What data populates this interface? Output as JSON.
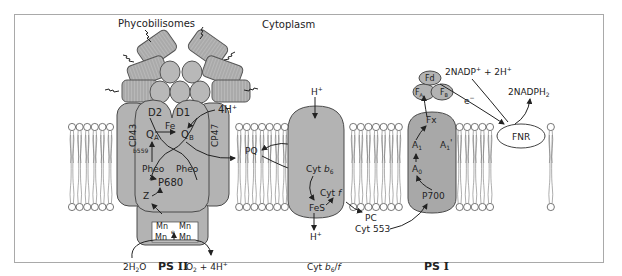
{
  "diagram": {
    "title_region": "Cytoplasm",
    "complexes": [
      {
        "id": "ps2",
        "label": "PS II",
        "subunits": [
          "CP43",
          "D2",
          "D1",
          "CP47"
        ]
      },
      {
        "id": "cytb6f",
        "label": "Cyt b6/f"
      },
      {
        "id": "ps1",
        "label": "PS I"
      }
    ],
    "labels": {
      "phycobilisomes": "Phycobilisomes",
      "cytoplasm": "Cytoplasm",
      "cp43": "CP43",
      "cp47": "CP47",
      "d2": "D2",
      "d1": "D1",
      "fe": "Fe",
      "qa": "Q",
      "qa_sub": "A",
      "qb": "Q",
      "qb_sub": "B",
      "b559": "b559",
      "pheo_left": "Pheo",
      "pheo_right": "Pheo",
      "p680": "P680",
      "z": "Z",
      "mn": "Mn",
      "e_minus_small": "e",
      "ps2_h_out": "4H",
      "h2o": "2H",
      "h2o_sub": "2",
      "h2o_tail": "O",
      "ps2_label": "PS",
      "ps2_roman": "II",
      "o2": "O",
      "o2_sub": "2",
      "o2_tail": " + 4H",
      "sup_plus": "+",
      "pq": "PQ",
      "cyt_h_in": "H",
      "cyt_b6": "Cyt",
      "cyt_b6_italic": "b",
      "cyt_b6_sub": "6",
      "cyt_f": "Cyt",
      "cyt_f_italic": "f",
      "fes": "FeS",
      "cyt_h_out": "H",
      "pc": "PC",
      "cyt553": "Cyt 553",
      "cytb6f_label_a": "Cyt",
      "cytb6f_label_b": "b",
      "cytb6f_label_sub": "6",
      "cytb6f_label_c": "/",
      "cytb6f_label_d": "f",
      "fd": "Fd",
      "fa": "F",
      "fa_sub": "A",
      "fb": "F",
      "fb_sub": "B",
      "fx": "Fx",
      "a1": "A",
      "a1_sub": "1",
      "a1p": "A",
      "a1p_sub": "1",
      "a1p_prime": "'",
      "a0": "A",
      "a0_sub": "0",
      "p700": "P700",
      "nadp": "2NADP",
      "nadp_tail": " + 2H",
      "nadph": "2NADPH",
      "nadph_sub": "2",
      "e_minus": "e",
      "minus": "−",
      "fnr": "FNR",
      "ps1_label": "PS",
      "ps1_roman": "I"
    },
    "colors": {
      "protein_fill": "#b3b3b3",
      "protein_stroke": "#4a4a4a",
      "membrane_head": "#ffffff",
      "frame": "#a9a9a9",
      "text": "#222222"
    }
  }
}
